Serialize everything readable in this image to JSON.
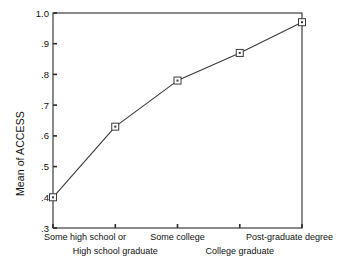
{
  "chart_data": {
    "type": "line",
    "title": "",
    "xlabel": "",
    "ylabel": "Mean of ACCESS",
    "categories": [
      "Some high school or",
      "High school graduate",
      "Some college",
      "College graduate",
      "Post-graduate degree"
    ],
    "values": [
      0.4,
      0.63,
      0.78,
      0.87,
      0.97
    ],
    "ylim": [
      0.3,
      1.0
    ],
    "ytick_labels": [
      "1.0",
      ".9",
      ".8",
      ".7",
      ".6",
      ".5",
      ".4",
      ".3"
    ],
    "ytick_values": [
      1.0,
      0.9,
      0.8,
      0.7,
      0.6,
      0.5,
      0.4,
      0.3
    ],
    "grid": false,
    "legend": "none",
    "marker": "open-square",
    "line_color": "#3a3a3a",
    "marker_color": "#3a3a3a",
    "axis_color": "#2b2b2b",
    "background": "#ffffff",
    "category_label_rows": [
      {
        "row": 0,
        "indices": [
          0,
          2,
          4
        ]
      },
      {
        "row": 1,
        "indices": [
          1,
          3
        ]
      }
    ]
  },
  "axes": {
    "y_title": "Mean of ACCESS"
  }
}
